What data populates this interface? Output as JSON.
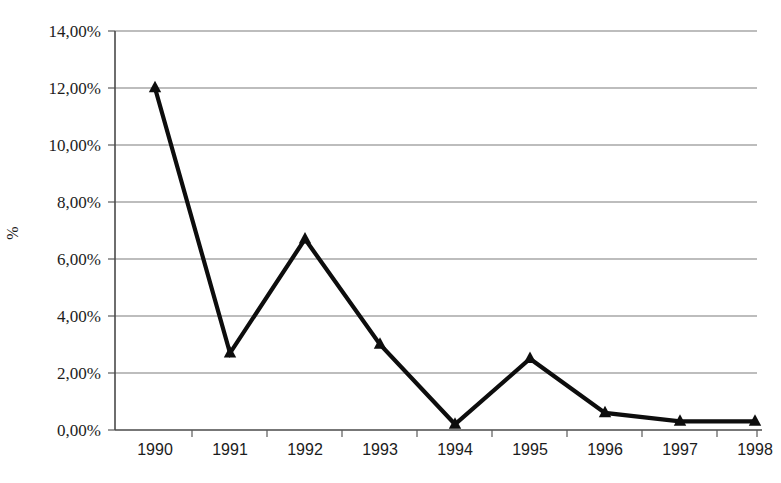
{
  "chart_data": {
    "type": "line",
    "title": "",
    "subtitle": "",
    "xlabel": "",
    "ylabel": "%",
    "categories": [
      "1990",
      "1991",
      "1992",
      "1993",
      "1994",
      "1995",
      "1996",
      "1997",
      "1998"
    ],
    "values": [
      12.0,
      2.7,
      6.7,
      3.0,
      0.2,
      2.5,
      0.6,
      0.3,
      0.3
    ],
    "series": [
      {
        "name": "",
        "values": [
          12.0,
          2.7,
          6.7,
          3.0,
          0.2,
          2.5,
          0.6,
          0.3,
          0.3
        ]
      }
    ],
    "ylim": [
      0,
      14
    ],
    "ytick_values": [
      0,
      2,
      4,
      6,
      8,
      10,
      12,
      14
    ],
    "ytick_labels": [
      "0,00%",
      "2,00%",
      "4,00%",
      "6,00%",
      "8,00%",
      "10,00%",
      "12,00%",
      "14,00%"
    ],
    "xtick_labels": [
      "1990",
      "1991",
      "1992",
      "1993",
      "1994",
      "1995",
      "1996",
      "1997",
      "1998"
    ],
    "grid": true,
    "grid_axis": "y",
    "legend": false,
    "legend_position": "none",
    "marker": "triangle",
    "line_color": "#0d0d0d",
    "grid_color": "#7d7d7d",
    "background_color": "#ffffff",
    "annotations": []
  },
  "axis": {
    "y_title": "%",
    "decimal_separator": ","
  }
}
